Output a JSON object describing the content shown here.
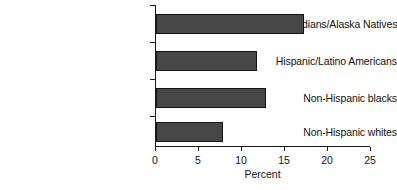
{
  "chart_data": {
    "type": "bar",
    "orientation": "horizontal",
    "title": "",
    "xlabel": "Percent",
    "ylabel": "",
    "xlim": [
      0,
      25
    ],
    "xticks": [
      0,
      5,
      10,
      15,
      20,
      25
    ],
    "xticklabels": [
      "0",
      "5",
      "10",
      "15",
      "20",
      "25"
    ],
    "grid": false,
    "legend": false,
    "bar_color": "#474747",
    "bar_edge_color": "#141414",
    "axis_color": "#1a1a1a",
    "categories": [
      "American Indians/Alaska Natives",
      "Hispanic/Latino Americans",
      "Non-Hispanic blacks",
      "Non-Hispanic whites"
    ],
    "values": [
      17.2,
      11.8,
      12.8,
      7.8
    ],
    "series": [
      {
        "name": "Percent",
        "values": [
          17.2,
          11.8,
          12.8,
          7.8
        ]
      }
    ]
  }
}
